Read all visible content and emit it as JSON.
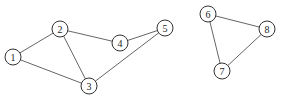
{
  "graph": {
    "node_radius": 8,
    "colors": {
      "edge": "#555555",
      "node_stroke": "#333333",
      "node_fill": "#ffffff",
      "label": "#222222"
    },
    "nodes": [
      {
        "id": "1",
        "label": "1",
        "x": 13,
        "y": 57
      },
      {
        "id": "2",
        "label": "2",
        "x": 60,
        "y": 29
      },
      {
        "id": "3",
        "label": "3",
        "x": 89,
        "y": 86
      },
      {
        "id": "4",
        "label": "4",
        "x": 120,
        "y": 43
      },
      {
        "id": "5",
        "label": "5",
        "x": 165,
        "y": 28
      },
      {
        "id": "6",
        "label": "6",
        "x": 208,
        "y": 14
      },
      {
        "id": "7",
        "label": "7",
        "x": 222,
        "y": 71
      },
      {
        "id": "8",
        "label": "8",
        "x": 267,
        "y": 29
      }
    ],
    "edges": [
      {
        "from": "1",
        "to": "2"
      },
      {
        "from": "1",
        "to": "3"
      },
      {
        "from": "2",
        "to": "3"
      },
      {
        "from": "2",
        "to": "4"
      },
      {
        "from": "4",
        "to": "5"
      },
      {
        "from": "3",
        "to": "5"
      },
      {
        "from": "6",
        "to": "8"
      },
      {
        "from": "6",
        "to": "7"
      },
      {
        "from": "7",
        "to": "8"
      }
    ]
  }
}
